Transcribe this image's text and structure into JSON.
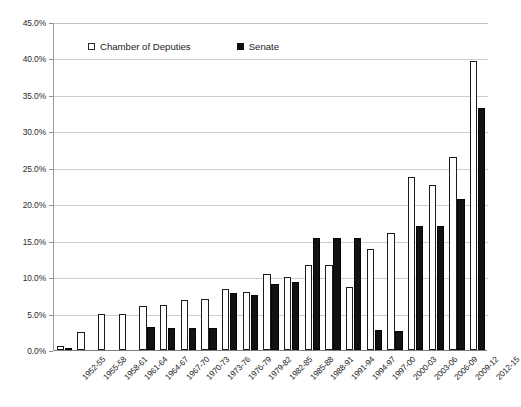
{
  "chart_data": {
    "type": "bar",
    "title": "",
    "xlabel": "",
    "ylabel": "",
    "ylim": [
      0,
      45
    ],
    "ytick_labels": [
      "0.0%",
      "5.0%",
      "10.0%",
      "15.0%",
      "20.0%",
      "25.0%",
      "30.0%",
      "35.0%",
      "40.0%",
      "45.0%"
    ],
    "ytick_values": [
      0,
      5,
      10,
      15,
      20,
      25,
      30,
      35,
      40,
      45
    ],
    "grid": true,
    "legend_position": "top-center",
    "categories": [
      "1952-55",
      "1955-58",
      "1958-61",
      "1961-64",
      "1964-67",
      "1967-70",
      "1970-73",
      "1973-76",
      "1976-79",
      "1979-82",
      "1982-85",
      "1985-88",
      "1988-91",
      "1991-94",
      "1994-97",
      "1997-00",
      "2000-03",
      "2003-06",
      "2006-09",
      "2009-12",
      "2012-15"
    ],
    "series": [
      {
        "name": "Chamber of Deputies",
        "color": "#ffffff",
        "values": [
          0.6,
          2.5,
          4.9,
          4.9,
          6.1,
          6.2,
          6.9,
          7.0,
          8.4,
          8.0,
          10.4,
          10.0,
          11.7,
          11.7,
          8.6,
          13.8,
          16.0,
          23.8,
          22.7,
          26.5,
          39.7
        ]
      },
      {
        "name": "Senate",
        "color": "#121212",
        "values": [
          0.3,
          0.0,
          0.0,
          0.0,
          3.1,
          3.0,
          3.0,
          3.0,
          7.8,
          7.6,
          9.0,
          9.3,
          15.3,
          15.4,
          15.4,
          2.8,
          2.6,
          17.0,
          17.0,
          20.7,
          33.2
        ]
      }
    ]
  },
  "legend": {
    "entries": [
      {
        "label": "Chamber of Deputies",
        "marker": "hollow-square-icon"
      },
      {
        "label": "Senate",
        "marker": "solid-square-icon"
      }
    ]
  },
  "footnote": {
    "text": ""
  }
}
